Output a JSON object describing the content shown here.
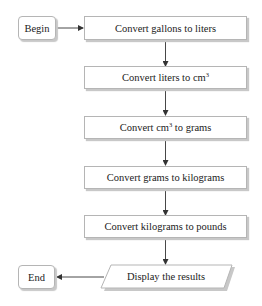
{
  "flowchart": {
    "start": {
      "label": "Begin"
    },
    "steps": [
      {
        "prefix": "Convert gallons to liters",
        "sup": "",
        "suffix": ""
      },
      {
        "prefix": "Convert liters to cm",
        "sup": "3",
        "suffix": ""
      },
      {
        "prefix": "Convert cm",
        "sup": "3",
        "suffix": " to grams"
      },
      {
        "prefix": "Convert grams to kilograms",
        "sup": "",
        "suffix": ""
      },
      {
        "prefix": "Convert kilograms to pounds",
        "sup": "",
        "suffix": ""
      }
    ],
    "output": {
      "label": "Display the results"
    },
    "end": {
      "label": "End"
    },
    "colors": {
      "line": "#333333",
      "border": "#b5b5b5",
      "shadow": "#c8c8c8",
      "text": "#222222"
    }
  }
}
